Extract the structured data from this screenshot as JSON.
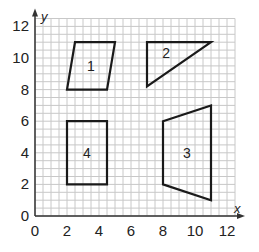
{
  "chart_data": {
    "type": "scatter",
    "title": "",
    "xlabel": "x",
    "ylabel": "y",
    "xlim": [
      0,
      12.5
    ],
    "ylim": [
      0,
      12.5
    ],
    "grid": true,
    "grid_step": 1,
    "x_ticks": [
      "0",
      "2",
      "4",
      "6",
      "8",
      "10",
      "12"
    ],
    "y_ticks": [
      "0",
      "2",
      "4",
      "6",
      "8",
      "10",
      "12"
    ],
    "shapes": [
      {
        "label": "1",
        "kind": "parallelogram",
        "points": [
          [
            2,
            8
          ],
          [
            4.5,
            8
          ],
          [
            5,
            11
          ],
          [
            2.5,
            11
          ]
        ],
        "label_pos": [
          3.5,
          9.5
        ]
      },
      {
        "label": "2",
        "kind": "triangle",
        "points": [
          [
            7,
            11
          ],
          [
            11,
            11
          ],
          [
            7,
            8.2
          ]
        ],
        "label_pos": [
          8.2,
          10.3
        ]
      },
      {
        "label": "3",
        "kind": "trapezoid",
        "points": [
          [
            8,
            6
          ],
          [
            11,
            7
          ],
          [
            11,
            1
          ],
          [
            8,
            2
          ]
        ],
        "label_pos": [
          9.5,
          4
        ]
      },
      {
        "label": "4",
        "kind": "rectangle",
        "points": [
          [
            2,
            2
          ],
          [
            4.5,
            2
          ],
          [
            4.5,
            6
          ],
          [
            2,
            6
          ]
        ],
        "label_pos": [
          3.25,
          4
        ]
      }
    ]
  },
  "colors": {
    "grid": "#c8c8c8",
    "axis": "#333333",
    "shape_stroke": "#1a1a1a",
    "text": "#222222"
  }
}
